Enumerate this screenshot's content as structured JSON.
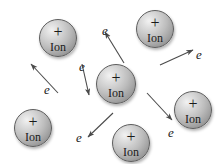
{
  "figure": {
    "title": "",
    "background_color": "#ffffff",
    "width": 222,
    "height": 164,
    "ion_label": "Ion",
    "ion_charge_symbol": "+",
    "electron_label": "e",
    "ion_body_color": "#bdbdbd",
    "ion_outline_color": "#5d5d5d",
    "ion_highlight_color": "#f2f2f2",
    "ion_shadow_color": "#7c7c7c",
    "arrow_color": "#4a4a4a",
    "text_color": "#1a1a1a"
  },
  "ions": [
    {
      "name": "ion-top-left",
      "cx": 58,
      "cy": 38,
      "r": 19,
      "charge": "+",
      "label": "Ion"
    },
    {
      "name": "ion-top-right",
      "cx": 155,
      "cy": 29,
      "r": 19,
      "charge": "+",
      "label": "Ion"
    },
    {
      "name": "ion-center",
      "cx": 116,
      "cy": 84,
      "r": 20,
      "charge": "+",
      "label": "Ion"
    },
    {
      "name": "ion-bottom-left",
      "cx": 33,
      "cy": 128,
      "r": 19,
      "charge": "+",
      "label": "Ion"
    },
    {
      "name": "ion-bottom-center",
      "cx": 131,
      "cy": 143,
      "r": 19,
      "charge": "+",
      "label": "Ion"
    },
    {
      "name": "ion-right",
      "cx": 193,
      "cy": 110,
      "r": 19,
      "charge": "+",
      "label": "Ion"
    }
  ],
  "electrons": [
    {
      "name": "electron-upper-left",
      "label": "e",
      "tail": {
        "x": 58,
        "y": 93
      },
      "head": {
        "x": 31,
        "y": 64
      },
      "label_pos": {
        "x": 44,
        "y": 83
      }
    },
    {
      "name": "electron-upper-mid",
      "label": "e",
      "tail": {
        "x": 82,
        "y": 64
      },
      "head": {
        "x": 89,
        "y": 95
      },
      "label_pos": {
        "x": 79,
        "y": 60
      }
    },
    {
      "name": "electron-center-up",
      "label": "e",
      "tail": {
        "x": 124,
        "y": 63
      },
      "head": {
        "x": 105,
        "y": 32
      },
      "label_pos": {
        "x": 102,
        "y": 24
      }
    },
    {
      "name": "electron-right-up",
      "label": "e",
      "tail": {
        "x": 160,
        "y": 65
      },
      "head": {
        "x": 193,
        "y": 50
      },
      "label_pos": {
        "x": 196,
        "y": 48
      }
    },
    {
      "name": "electron-lower-right",
      "label": "e",
      "tail": {
        "x": 147,
        "y": 93
      },
      "head": {
        "x": 172,
        "y": 120
      },
      "label_pos": {
        "x": 168,
        "y": 126
      }
    },
    {
      "name": "electron-lower-left",
      "label": "e",
      "tail": {
        "x": 113,
        "y": 113
      },
      "head": {
        "x": 88,
        "y": 137
      },
      "label_pos": {
        "x": 76,
        "y": 131
      }
    }
  ]
}
